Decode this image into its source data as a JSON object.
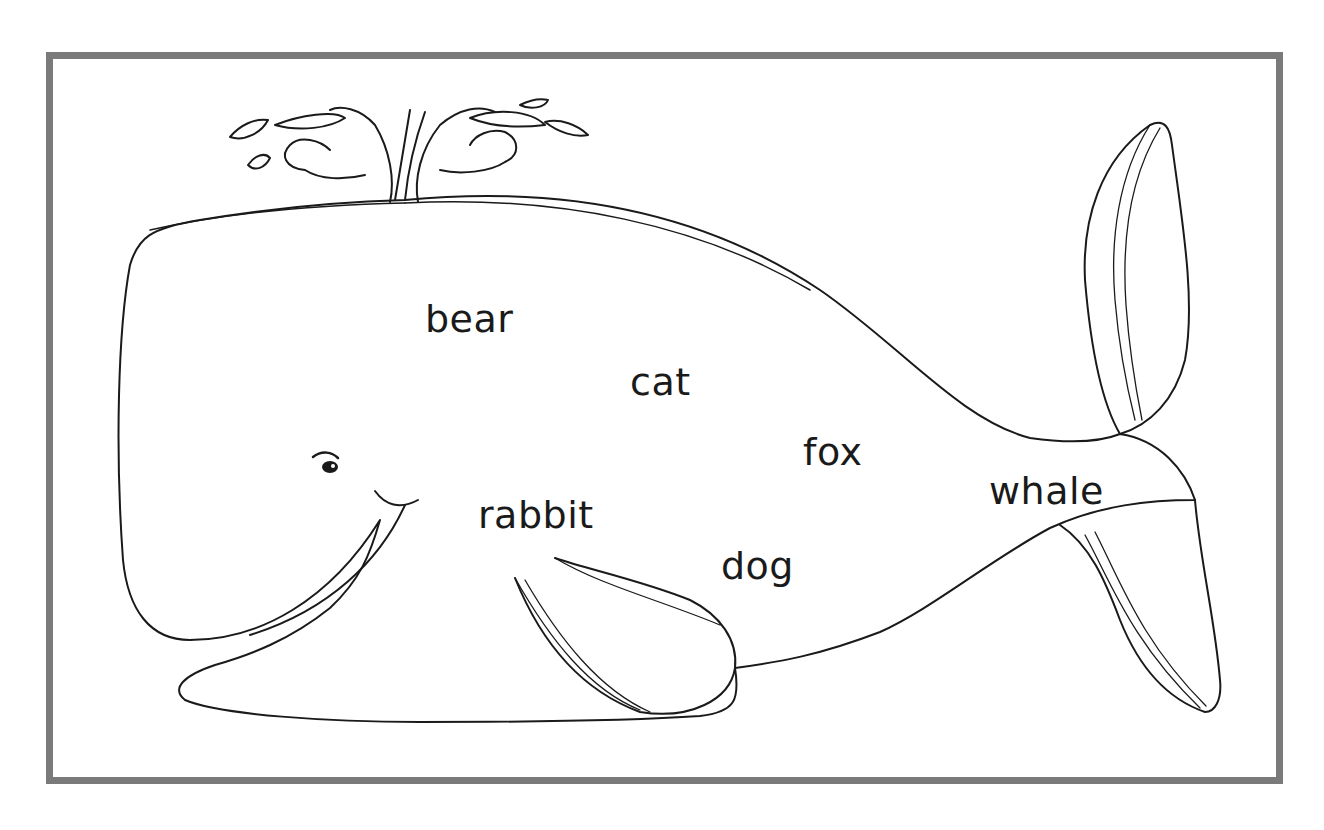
{
  "worksheet": {
    "subject": "whale",
    "frame_color": "#7a7a7a",
    "ink_color": "#1a1a1a",
    "words": [
      {
        "text": "bear",
        "x": 425,
        "y": 300
      },
      {
        "text": "cat",
        "x": 630,
        "y": 363
      },
      {
        "text": "fox",
        "x": 803,
        "y": 433
      },
      {
        "text": "whale",
        "x": 989,
        "y": 472
      },
      {
        "text": "rabbit",
        "x": 478,
        "y": 496
      },
      {
        "text": "dog",
        "x": 721,
        "y": 547
      }
    ]
  }
}
